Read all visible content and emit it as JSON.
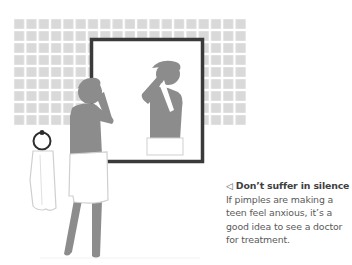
{
  "illustration": {
    "description": "Teen boy in a towel looking at pimples in a bathroom mirror",
    "colors": {
      "tile": "#d9d9d9",
      "grout": "#ffffff",
      "figure": "#8c8c8c",
      "mirror_frame": "#3a3a3a",
      "towel_outline": "#cfcfcf",
      "towel_ring": "#2e2e2e"
    }
  },
  "caption": {
    "arrow_icon": "◁",
    "title": "Don’t suffer in silence",
    "body": "If pimples are making a teen feel anxious, it’s a good idea to see a doctor for treatment."
  }
}
